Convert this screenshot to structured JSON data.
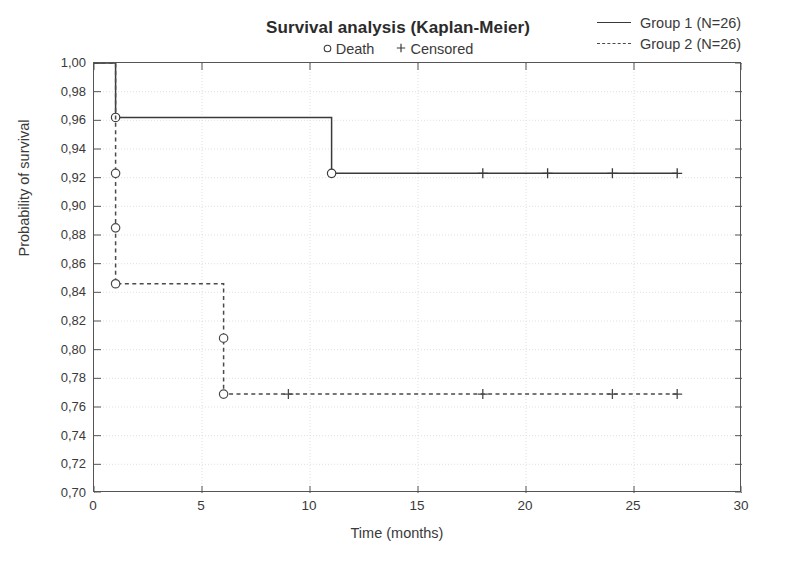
{
  "header": {
    "title": "Survival analysis (Kaplan-Meier)",
    "subtitle_items": [
      {
        "marker": "circle",
        "label": "Death"
      },
      {
        "marker": "plus",
        "label": "Censored"
      }
    ]
  },
  "legend": {
    "position": "top-right",
    "entries": [
      {
        "label": "Group 1 (N=26)",
        "style": "solid",
        "color": "#3a3a3a"
      },
      {
        "label": "Group 2 (N=26)",
        "style": "dashed",
        "color": "#4a4a4a"
      }
    ]
  },
  "chart_data": {
    "type": "line",
    "title": "Survival analysis (Kaplan-Meier)",
    "subtitle": "Death / Censored",
    "xlabel": "Time (months)",
    "ylabel": "Probability of survival",
    "xlim": [
      0,
      30
    ],
    "ylim": [
      0.7,
      1.0
    ],
    "xticks": [
      0,
      5,
      10,
      15,
      20,
      25,
      30
    ],
    "xticklabels": [
      "0",
      "5",
      "10",
      "15",
      "20",
      "25",
      "30"
    ],
    "yticks": [
      0.7,
      0.72,
      0.74,
      0.76,
      0.78,
      0.8,
      0.82,
      0.84,
      0.86,
      0.88,
      0.9,
      0.92,
      0.94,
      0.96,
      0.98,
      1.0
    ],
    "yticklabels": [
      "0,70",
      "0,72",
      "0,74",
      "0,76",
      "0,78",
      "0,80",
      "0,82",
      "0,84",
      "0,86",
      "0,88",
      "0,90",
      "0,92",
      "0,94",
      "0,96",
      "0,98",
      "1,00"
    ],
    "grid": true,
    "decimal_separator": ",",
    "series": [
      {
        "name": "Group 1 (N=26)",
        "style": "solid",
        "color": "#3a3a3a",
        "steps": [
          {
            "x": 1,
            "y": 0.962
          },
          {
            "x": 11,
            "y": 0.923
          },
          {
            "x": 27,
            "y": 0.923
          }
        ],
        "deaths": [
          {
            "x": 1,
            "y": 0.962
          },
          {
            "x": 11,
            "y": 0.923
          }
        ],
        "censored": [
          {
            "x": 18,
            "y": 0.923
          },
          {
            "x": 21,
            "y": 0.923
          },
          {
            "x": 24,
            "y": 0.923
          },
          {
            "x": 27,
            "y": 0.923
          }
        ]
      },
      {
        "name": "Group 2 (N=26)",
        "style": "dashed",
        "color": "#4a4a4a",
        "steps": [
          {
            "x": 1,
            "y": 0.846
          },
          {
            "x": 6,
            "y": 0.769
          },
          {
            "x": 27,
            "y": 0.769
          }
        ],
        "deaths": [
          {
            "x": 1,
            "y": 0.923
          },
          {
            "x": 1,
            "y": 0.885
          },
          {
            "x": 1,
            "y": 0.846
          },
          {
            "x": 6,
            "y": 0.808
          },
          {
            "x": 6,
            "y": 0.769
          }
        ],
        "censored": [
          {
            "x": 9,
            "y": 0.769
          },
          {
            "x": 18,
            "y": 0.769
          },
          {
            "x": 24,
            "y": 0.769
          },
          {
            "x": 27,
            "y": 0.769
          }
        ],
        "drop_from": 0.962
      }
    ]
  }
}
